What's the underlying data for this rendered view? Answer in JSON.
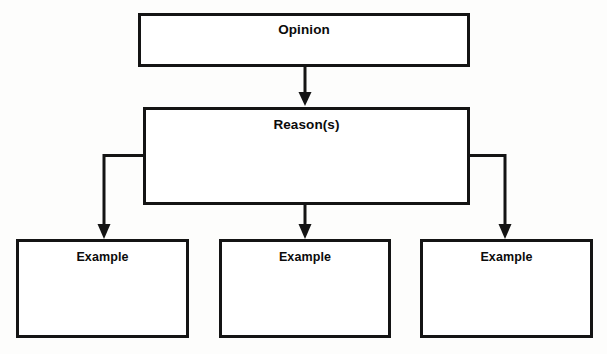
{
  "diagram": {
    "type": "hierarchy-flowchart",
    "background_color": "#fdfdfc",
    "line_color": "#141414",
    "box_fill_color": "#ffffff",
    "nodes": [
      {
        "id": "opinion",
        "label": "Opinion",
        "level": 1,
        "writing_space": ""
      },
      {
        "id": "reasons",
        "label": "Reason(s)",
        "level": 2,
        "writing_space": ""
      },
      {
        "id": "example-1",
        "label": "Example",
        "level": 3,
        "writing_space": ""
      },
      {
        "id": "example-2",
        "label": "Example",
        "level": 3,
        "writing_space": ""
      },
      {
        "id": "example-3",
        "label": "Example",
        "level": 3,
        "writing_space": ""
      }
    ],
    "edges": [
      {
        "id": "opinion-to-reasons",
        "from": "opinion",
        "to": "reasons",
        "style": "straight-down",
        "arrowhead": true
      },
      {
        "id": "reasons-to-example-1",
        "from": "reasons",
        "to": "example-1",
        "style": "elbow-left",
        "arrowhead": true
      },
      {
        "id": "reasons-to-example-2",
        "from": "reasons",
        "to": "example-2",
        "style": "straight-down",
        "arrowhead": true
      },
      {
        "id": "reasons-to-example-3",
        "from": "reasons",
        "to": "example-3",
        "style": "elbow-right",
        "arrowhead": true
      }
    ]
  }
}
